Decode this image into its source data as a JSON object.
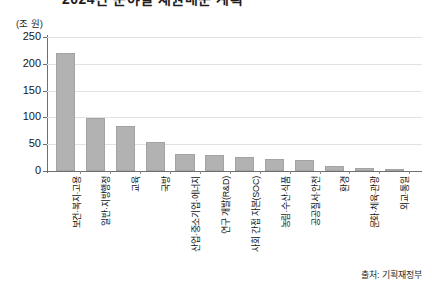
{
  "header": {
    "clipped_title": "2024년 분야별 재원배분 계획"
  },
  "chart_data": {
    "type": "bar",
    "title": "",
    "unit_label": "(조 원)",
    "xlabel": "",
    "ylabel": "",
    "ylim": [
      0,
      250
    ],
    "yticks": [
      0,
      50,
      100,
      150,
      200,
      250
    ],
    "grid": true,
    "legend": "none",
    "bar_color": "#b2b2b2",
    "bar_border_color": "#a3a3a3",
    "categories": [
      "보건·복지·고용",
      "일반·지방행정",
      "교육",
      "국방",
      "산업·중소기업·에너지",
      "연구 개발(R&D)",
      "사회 간접 자본(SOC)",
      "농림·수산·식품",
      "공공질서·안전",
      "환경",
      "문화·체육·관광",
      "외교·통일"
    ],
    "values": [
      220,
      98,
      84,
      55,
      31,
      30,
      27,
      23,
      21,
      10,
      6,
      3
    ]
  },
  "footer": {
    "source": "출처: 기획재정부"
  }
}
